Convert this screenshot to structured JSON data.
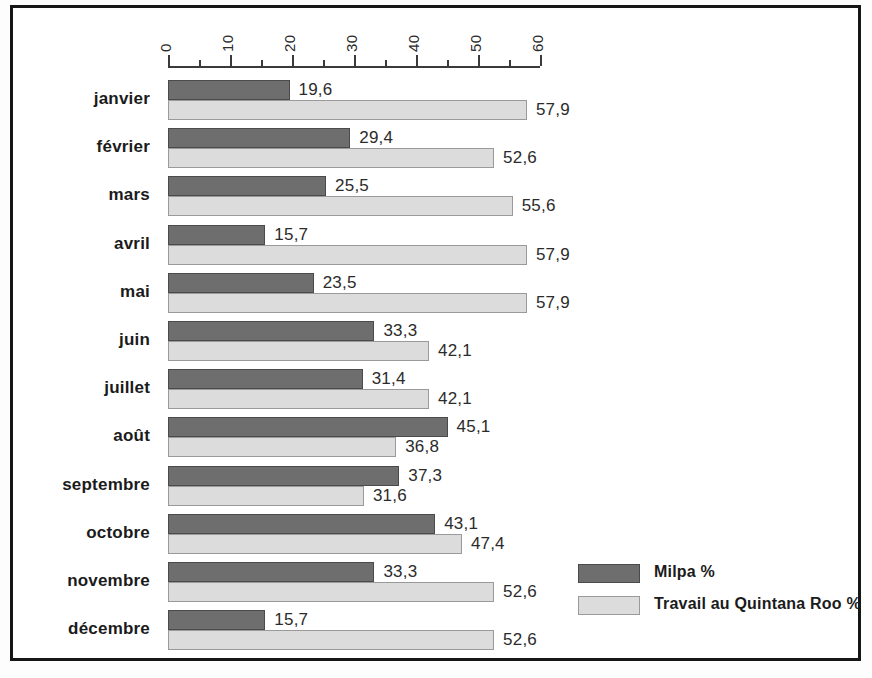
{
  "chart_data": {
    "type": "bar",
    "orientation": "horizontal",
    "title": "",
    "xlabel": "",
    "ylabel": "",
    "xlim": [
      0,
      60
    ],
    "grid": false,
    "legend_position": "bottom-right",
    "axis": {
      "major_ticks": [
        0,
        10,
        20,
        30,
        40,
        50,
        60
      ],
      "major_tick_labels": [
        "0",
        "10",
        "20",
        "30",
        "40",
        "50",
        "60"
      ],
      "minor_ticks": [
        5,
        15,
        25,
        35,
        45,
        55
      ],
      "tick_label_rotation": 90
    },
    "categories": [
      "janvier",
      "février",
      "mars",
      "avril",
      "mai",
      "juin",
      "juillet",
      "août",
      "septembre",
      "octobre",
      "novembre",
      "décembre"
    ],
    "series": [
      {
        "name": "Milpa %",
        "color": "#6e6e6e",
        "values": [
          19.6,
          29.4,
          25.5,
          15.7,
          23.5,
          33.3,
          31.4,
          45.1,
          37.3,
          43.1,
          33.3,
          15.7
        ],
        "value_labels": [
          "19,6",
          "29,4",
          "25,5",
          "15,7",
          "23,5",
          "33,3",
          "31,4",
          "45,1",
          "37,3",
          "43,1",
          "33,3",
          "15,7"
        ]
      },
      {
        "name": "Travail au Quintana Roo %",
        "color": "#dcdcdc",
        "values": [
          57.9,
          52.6,
          55.6,
          57.9,
          57.9,
          42.1,
          42.1,
          36.8,
          31.6,
          47.4,
          52.6,
          52.6
        ],
        "value_labels": [
          "57,9",
          "52,6",
          "55,6",
          "57,9",
          "57,9",
          "42,1",
          "42,1",
          "36,8",
          "31,6",
          "47,4",
          "52,6",
          "52,6"
        ]
      }
    ]
  },
  "legend": {
    "items": [
      {
        "label": "Milpa %",
        "color": "#6e6e6e"
      },
      {
        "label": "Travail au Quintana Roo %",
        "color": "#dcdcdc"
      }
    ]
  }
}
